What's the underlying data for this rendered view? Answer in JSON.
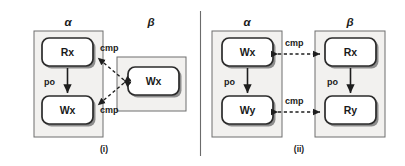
{
  "figure": {
    "divider_present": true,
    "colors": {
      "thread_fill": "#f2f1ef",
      "thread_stroke": "#6e6e6e",
      "event_fill": "#ffffff",
      "event_stroke": "#2b2b2b",
      "shadow": "#8d8d8d",
      "arrow": "#1e1e1e",
      "text": "#1a1a1a",
      "background": "#ffffff"
    },
    "panels": [
      {
        "id": "panel-i",
        "caption": "(i)",
        "threads": [
          {
            "id": "panel-i-alpha",
            "label": "α",
            "events": [
              {
                "id": "i-alpha-rx",
                "label": "Rx"
              },
              {
                "id": "i-alpha-wx",
                "label": "Wx"
              }
            ]
          },
          {
            "id": "panel-i-beta",
            "label": "β",
            "events": [
              {
                "id": "i-beta-wx",
                "label": "Wx"
              }
            ]
          }
        ],
        "relations": [
          {
            "id": "i-po-1",
            "label": "po",
            "kind": "program-order",
            "from": "i-alpha-rx",
            "to": "i-alpha-wx"
          },
          {
            "id": "i-cmp-1",
            "label": "cmp",
            "kind": "compare",
            "from": "i-beta-wx",
            "to": "i-alpha-rx"
          },
          {
            "id": "i-cmp-2",
            "label": "cmp",
            "kind": "compare",
            "from": "i-beta-wx",
            "to": "i-alpha-wx"
          }
        ]
      },
      {
        "id": "panel-ii",
        "caption": "(ii)",
        "threads": [
          {
            "id": "panel-ii-alpha",
            "label": "α",
            "events": [
              {
                "id": "ii-alpha-wx",
                "label": "Wx"
              },
              {
                "id": "ii-alpha-wy",
                "label": "Wy"
              }
            ]
          },
          {
            "id": "panel-ii-beta",
            "label": "β",
            "events": [
              {
                "id": "ii-beta-rx",
                "label": "Rx"
              },
              {
                "id": "ii-beta-ry",
                "label": "Ry"
              }
            ]
          }
        ],
        "relations": [
          {
            "id": "ii-po-1",
            "label": "po",
            "kind": "program-order",
            "from": "ii-alpha-wx",
            "to": "ii-alpha-wy"
          },
          {
            "id": "ii-po-2",
            "label": "po",
            "kind": "program-order",
            "from": "ii-beta-rx",
            "to": "ii-beta-ry"
          },
          {
            "id": "ii-cmp-1",
            "label": "cmp",
            "kind": "compare",
            "from": "ii-alpha-wx",
            "to": "ii-beta-rx"
          },
          {
            "id": "ii-cmp-2",
            "label": "cmp",
            "kind": "compare",
            "from": "ii-alpha-wy",
            "to": "ii-beta-ry"
          }
        ]
      }
    ]
  }
}
